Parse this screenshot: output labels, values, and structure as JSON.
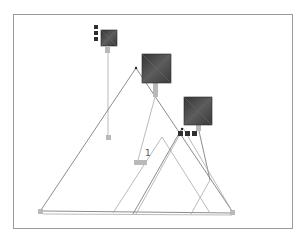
{
  "diagram": {
    "frame": {
      "x": 13,
      "y": 14,
      "w": 280,
      "h": 215,
      "border_color": "#9a9a9a"
    },
    "colors": {
      "node_dark": "#3e3e3e",
      "node_dark_light": "#6a6a6a",
      "connector": "#b9b9b9",
      "line": "#6f6f6f",
      "line_light": "#a9a9a9",
      "small_square": "#2f2f2f"
    },
    "big_nodes": [
      {
        "id": "node-a",
        "x": 101,
        "y": 30,
        "size": 16
      },
      {
        "id": "node-b",
        "x": 142,
        "y": 54,
        "size": 29
      },
      {
        "id": "node-c",
        "x": 184,
        "y": 97,
        "size": 28
      }
    ],
    "small_square_groups": [
      {
        "id": "group-a",
        "squares": [
          [
            94,
            25
          ],
          [
            94,
            31
          ],
          [
            94,
            37
          ]
        ],
        "size": 4
      },
      {
        "id": "group-c",
        "squares": [
          [
            178,
            131
          ],
          [
            185,
            131
          ],
          [
            192,
            131
          ]
        ],
        "size": 5
      }
    ],
    "connectors": [
      {
        "id": "stub-a",
        "x": 105,
        "y": 47,
        "w": 5,
        "h": 6
      },
      {
        "id": "stub-b",
        "x": 153,
        "y": 83,
        "w": 5,
        "h": 14
      },
      {
        "id": "stub-c",
        "x": 196,
        "y": 125,
        "w": 5,
        "h": 6
      },
      {
        "id": "end-a",
        "x": 106,
        "y": 135,
        "w": 5,
        "h": 5
      },
      {
        "id": "end-b",
        "x": 134,
        "y": 160,
        "w": 13,
        "h": 5
      },
      {
        "id": "end-left",
        "x": 38,
        "y": 209,
        "w": 5,
        "h": 5
      },
      {
        "id": "end-right",
        "x": 230,
        "y": 210,
        "w": 5,
        "h": 5
      }
    ],
    "lines": [
      {
        "x1": 108,
        "y1": 53,
        "x2": 108,
        "y2": 135,
        "style": "light"
      },
      {
        "x1": 136,
        "y1": 68,
        "x2": 41,
        "y2": 210,
        "style": "dark"
      },
      {
        "x1": 136,
        "y1": 68,
        "x2": 232,
        "y2": 211,
        "style": "dark"
      },
      {
        "x1": 155,
        "y1": 97,
        "x2": 138,
        "y2": 160,
        "style": "light"
      },
      {
        "x1": 43,
        "y1": 211,
        "x2": 232,
        "y2": 213,
        "style": "dark"
      },
      {
        "x1": 43,
        "y1": 214,
        "x2": 232,
        "y2": 215,
        "style": "light"
      },
      {
        "x1": 162,
        "y1": 137,
        "x2": 113,
        "y2": 213,
        "style": "light"
      },
      {
        "x1": 162,
        "y1": 137,
        "x2": 210,
        "y2": 213,
        "style": "light"
      },
      {
        "x1": 181,
        "y1": 130,
        "x2": 133,
        "y2": 214,
        "style": "dark"
      },
      {
        "x1": 179,
        "y1": 136,
        "x2": 136,
        "y2": 214,
        "style": "light"
      },
      {
        "x1": 199,
        "y1": 131,
        "x2": 210,
        "y2": 180,
        "style": "dark"
      },
      {
        "x1": 210,
        "y1": 180,
        "x2": 191,
        "y2": 214,
        "style": "light"
      },
      {
        "x1": 183,
        "y1": 128,
        "x2": 232,
        "y2": 211,
        "style": "light"
      }
    ],
    "dots": [
      {
        "x": 136,
        "y": 68
      },
      {
        "x": 182,
        "y": 129
      }
    ],
    "label_marker": {
      "text": "1",
      "x": 145,
      "y": 156
    },
    "caption": ""
  }
}
